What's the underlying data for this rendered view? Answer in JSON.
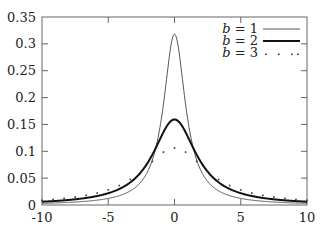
{
  "chart_data": {
    "type": "line",
    "title": "",
    "xlabel": "",
    "ylabel": "",
    "xlim": [
      -10,
      10
    ],
    "ylim": [
      0,
      0.35
    ],
    "xticks": [
      -10,
      -5,
      0,
      5,
      10
    ],
    "xtick_labels": [
      "-10",
      "-5",
      "0",
      "5",
      "10"
    ],
    "yticks": [
      0,
      0.05,
      0.1,
      0.15,
      0.2,
      0.25,
      0.3,
      0.35
    ],
    "ytick_labels": [
      "0",
      "0.05",
      "0.1",
      "0.15",
      "0.2",
      "0.25",
      "0.3",
      "0.35"
    ],
    "grid": false,
    "legend_position": "top-right",
    "function": "f(x) = b / (pi * (b^2 + x^2))",
    "series": [
      {
        "name": "b = 1",
        "b": 1,
        "style": "thin-line",
        "color": "#555555",
        "peak": 0.318
      },
      {
        "name": "b = 2",
        "b": 2,
        "style": "thick-line",
        "color": "#111111",
        "peak": 0.159
      },
      {
        "name": "b = 3",
        "b": 3,
        "style": "dots",
        "color": "#333333",
        "peak": 0.106
      }
    ],
    "samples": 25
  },
  "legend": {
    "entries": [
      {
        "label_var": "b",
        "label_rest": " = 1"
      },
      {
        "label_var": "b",
        "label_rest": " = 2"
      },
      {
        "label_var": "b",
        "label_rest": " = 3"
      }
    ]
  },
  "colors": {
    "frame": "#666666",
    "background": "#ffffff"
  }
}
